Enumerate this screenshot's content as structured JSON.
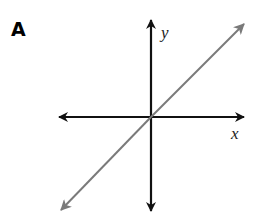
{
  "panel": {
    "label": "A"
  },
  "axes": {
    "x_label": "x",
    "y_label": "y",
    "axis_color": "#111111"
  },
  "line": {
    "description": "straight line through the origin with positive slope, arrows on both ends",
    "color": "#7a7a7a"
  }
}
